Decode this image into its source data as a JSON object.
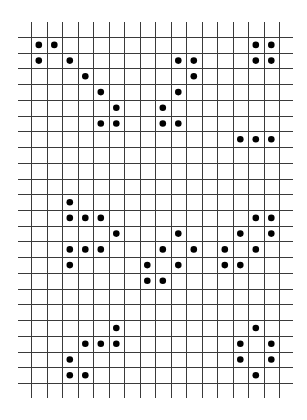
{
  "diagram": {
    "type": "cell-grid",
    "title": "",
    "grid": {
      "columns": 16,
      "rows": 22,
      "line_color": "#3a3a3a",
      "cell_fill": "#ffffff",
      "dot_color": "#000000"
    },
    "patterns": [
      {
        "name": "top-left",
        "cells": [
          [
            0,
            0
          ],
          [
            1,
            0
          ],
          [
            0,
            1
          ],
          [
            2,
            1
          ],
          [
            3,
            2
          ],
          [
            4,
            3
          ],
          [
            5,
            4
          ],
          [
            4,
            5
          ],
          [
            5,
            5
          ]
        ]
      },
      {
        "name": "top-middle",
        "cells": [
          [
            9,
            1
          ],
          [
            10,
            1
          ],
          [
            10,
            2
          ],
          [
            9,
            3
          ],
          [
            8,
            4
          ],
          [
            8,
            5
          ],
          [
            9,
            5
          ]
        ]
      },
      {
        "name": "top-right-block",
        "cells": [
          [
            14,
            0
          ],
          [
            15,
            0
          ],
          [
            14,
            1
          ],
          [
            15,
            1
          ]
        ]
      },
      {
        "name": "right-row",
        "cells": [
          [
            13,
            6
          ],
          [
            14,
            6
          ],
          [
            15,
            6
          ]
        ]
      },
      {
        "name": "middle-left",
        "cells": [
          [
            2,
            10
          ],
          [
            2,
            11
          ],
          [
            3,
            11
          ],
          [
            4,
            11
          ],
          [
            5,
            12
          ],
          [
            2,
            13
          ],
          [
            3,
            13
          ],
          [
            4,
            13
          ],
          [
            2,
            14
          ]
        ]
      },
      {
        "name": "middle-center",
        "cells": [
          [
            9,
            12
          ],
          [
            8,
            13
          ],
          [
            10,
            13
          ],
          [
            7,
            14
          ],
          [
            9,
            14
          ],
          [
            7,
            15
          ],
          [
            8,
            15
          ]
        ]
      },
      {
        "name": "middle-right",
        "cells": [
          [
            14,
            11
          ],
          [
            15,
            11
          ],
          [
            13,
            12
          ],
          [
            15,
            12
          ],
          [
            12,
            13
          ],
          [
            14,
            13
          ],
          [
            12,
            14
          ],
          [
            13,
            14
          ]
        ]
      },
      {
        "name": "bottom-left",
        "cells": [
          [
            5,
            18
          ],
          [
            3,
            19
          ],
          [
            4,
            19
          ],
          [
            5,
            19
          ],
          [
            2,
            20
          ],
          [
            2,
            21
          ],
          [
            3,
            21
          ]
        ]
      },
      {
        "name": "bottom-right",
        "cells": [
          [
            14,
            18
          ],
          [
            13,
            19
          ],
          [
            15,
            19
          ],
          [
            13,
            20
          ],
          [
            15,
            20
          ],
          [
            14,
            21
          ]
        ]
      }
    ]
  }
}
